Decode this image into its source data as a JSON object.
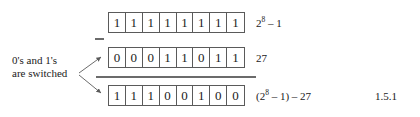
{
  "figure": {
    "equation_number": "1.5.1",
    "operator": "minus",
    "annotation": {
      "line1": "0's and 1's",
      "line2": "are switched"
    },
    "rows": [
      {
        "name": "all-ones",
        "bits": [
          "1",
          "1",
          "1",
          "1",
          "1",
          "1",
          "1",
          "1"
        ],
        "label_prefix": "2",
        "label_exponent": "8",
        "label_suffix": " – 1",
        "label_text": "2^8 – 1"
      },
      {
        "name": "value-27",
        "bits": [
          "0",
          "0",
          "0",
          "1",
          "1",
          "0",
          "1",
          "1"
        ],
        "label_prefix": "",
        "label_exponent": "",
        "label_suffix": "27",
        "label_text": "27"
      },
      {
        "name": "complement-result",
        "bits": [
          "1",
          "1",
          "1",
          "0",
          "0",
          "1",
          "0",
          "0"
        ],
        "label_prefix": "(2",
        "label_exponent": "8",
        "label_suffix": " – 1) – 27",
        "label_text": "(2^8 – 1) – 27"
      }
    ],
    "colors": {
      "background": "#ffffff",
      "ink": "#1a1a1a",
      "rule": "#6b6b6b",
      "box_border": "#5a5a5a"
    }
  }
}
